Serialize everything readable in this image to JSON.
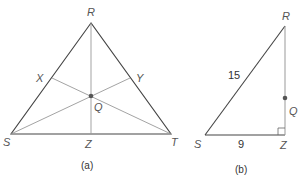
{
  "figures": [
    {
      "caption": "(a)",
      "vertices": {
        "R": "R",
        "S": "S",
        "T": "T"
      },
      "points": {
        "X": "X",
        "Y": "Y",
        "Z": "Z",
        "Q": "Q"
      }
    },
    {
      "caption": "(b)",
      "vertices": {
        "R": "R",
        "S": "S",
        "Z": "Z"
      },
      "points": {
        "Q": "Q"
      },
      "side_labels": {
        "SR": "15",
        "SZ": "9"
      }
    }
  ],
  "colors": {
    "stroke_dark": "#444444",
    "stroke_light": "#999999",
    "dot": "#555555"
  }
}
